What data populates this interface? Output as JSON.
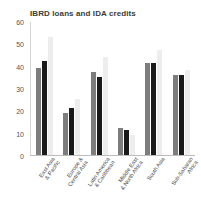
{
  "chart_data": {
    "type": "bar",
    "title": "IBRD loans and IDA credits",
    "xlabel": "",
    "ylabel": "",
    "ylim": [
      0,
      60
    ],
    "yticks": [
      0,
      10,
      20,
      30,
      40,
      50,
      60
    ],
    "grid": false,
    "legend": "none",
    "categories": [
      "East Asia & Pacific",
      "Europe & Central Asia",
      "Latin America & Caribbean",
      "Middle East & North Africa",
      "South Asia",
      "Sub-Saharan Africa"
    ],
    "category_lines": [
      [
        "East Asia",
        "& Pacific"
      ],
      [
        "Europe &",
        "Central Asia"
      ],
      [
        "Latin America",
        "& Caribbean"
      ],
      [
        "Middle East",
        "& North Africa"
      ],
      [
        "South Asia"
      ],
      [
        "Sub-Saharan",
        "Africa"
      ]
    ],
    "series": [
      {
        "name": "series-1",
        "color": "#7d7d7d",
        "values": [
          39,
          19,
          37,
          12,
          41,
          36
        ]
      },
      {
        "name": "series-2",
        "color": "#1a1a1a",
        "values": [
          42,
          21,
          35,
          11,
          41,
          36
        ]
      },
      {
        "name": "series-3",
        "color": "#ededed",
        "values": [
          53,
          25,
          44,
          9,
          47,
          38
        ]
      }
    ]
  }
}
